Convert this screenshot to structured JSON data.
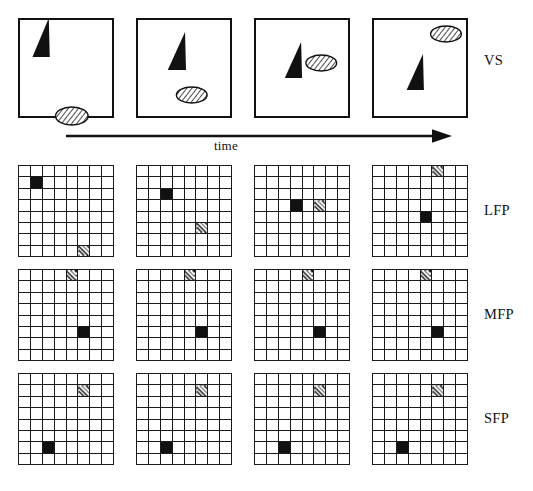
{
  "figure": {
    "colors": {
      "ink": "#111111",
      "background": "#ffffff",
      "grid_line": "#1a1a1a",
      "active_cell": "#111111",
      "hatch_cell": "#141414"
    },
    "time_axis": {
      "label": "time",
      "direction": "left-to-right",
      "arrowhead": "right"
    },
    "row_labels": [
      {
        "id": "vs",
        "text": "VS"
      },
      {
        "id": "lfp",
        "text": "LFP"
      },
      {
        "id": "mfp",
        "text": "MFP"
      },
      {
        "id": "sfp",
        "text": "SFP"
      }
    ],
    "timesteps": 4,
    "grid": {
      "rows": 8,
      "cols": 8
    },
    "vs_frames": [
      {
        "index": 1,
        "triangle": {
          "apex_x_pct": 30,
          "apex_y_pct": -2,
          "base_left_x_pct": 13,
          "base_right_x_pct": 31,
          "base_y_pct": 37
        },
        "ellipse": {
          "cx_pct": 54,
          "cy_pct": 96,
          "rx_pct": 17,
          "ry_pct": 9,
          "fill": "hatched"
        }
      },
      {
        "index": 2,
        "triangle": {
          "apex_x_pct": 49,
          "apex_y_pct": 12,
          "base_left_x_pct": 31,
          "base_right_x_pct": 50,
          "base_y_pct": 50
        },
        "ellipse": {
          "cx_pct": 56,
          "cy_pct": 75,
          "rx_pct": 16,
          "ry_pct": 8,
          "fill": "hatched"
        }
      },
      {
        "index": 3,
        "triangle": {
          "apex_x_pct": 47,
          "apex_y_pct": 22,
          "base_left_x_pct": 30,
          "base_right_x_pct": 48,
          "base_y_pct": 58
        },
        "ellipse": {
          "cx_pct": 68,
          "cy_pct": 43,
          "rx_pct": 16,
          "ry_pct": 8,
          "fill": "hatched"
        }
      },
      {
        "index": 4,
        "triangle": {
          "apex_x_pct": 51,
          "apex_y_pct": 34,
          "base_left_x_pct": 34,
          "base_right_x_pct": 52,
          "base_y_pct": 70
        },
        "ellipse": {
          "cx_pct": 75,
          "cy_pct": 14,
          "rx_pct": 16,
          "ry_pct": 8,
          "fill": "hatched"
        }
      }
    ],
    "feature_planes": [
      {
        "id": "lfp",
        "label": "LFP",
        "frames": [
          {
            "index": 1,
            "active_cell": {
              "row": 2,
              "col": 2
            },
            "hatch_cell": {
              "row": 8,
              "col": 6
            }
          },
          {
            "index": 2,
            "active_cell": {
              "row": 3,
              "col": 3
            },
            "hatch_cell": {
              "row": 6,
              "col": 6
            }
          },
          {
            "index": 3,
            "active_cell": {
              "row": 4,
              "col": 4
            },
            "hatch_cell": {
              "row": 4,
              "col": 6
            }
          },
          {
            "index": 4,
            "active_cell": {
              "row": 5,
              "col": 5
            },
            "hatch_cell": {
              "row": 1,
              "col": 6
            }
          }
        ]
      },
      {
        "id": "mfp",
        "label": "MFP",
        "frames": [
          {
            "index": 1,
            "active_cell": {
              "row": 6,
              "col": 6
            },
            "hatch_cell": {
              "row": 1,
              "col": 5
            }
          },
          {
            "index": 2,
            "active_cell": {
              "row": 6,
              "col": 6
            },
            "hatch_cell": {
              "row": 1,
              "col": 5
            }
          },
          {
            "index": 3,
            "active_cell": {
              "row": 6,
              "col": 6
            },
            "hatch_cell": {
              "row": 1,
              "col": 5
            }
          },
          {
            "index": 4,
            "active_cell": {
              "row": 6,
              "col": 6
            },
            "hatch_cell": {
              "row": 1,
              "col": 5
            }
          }
        ]
      },
      {
        "id": "sfp",
        "label": "SFP",
        "frames": [
          {
            "index": 1,
            "active_cell": {
              "row": 7,
              "col": 3
            },
            "hatch_cell": {
              "row": 2,
              "col": 6
            }
          },
          {
            "index": 2,
            "active_cell": {
              "row": 7,
              "col": 3
            },
            "hatch_cell": {
              "row": 2,
              "col": 6
            }
          },
          {
            "index": 3,
            "active_cell": {
              "row": 7,
              "col": 3
            },
            "hatch_cell": {
              "row": 2,
              "col": 6
            }
          },
          {
            "index": 4,
            "active_cell": {
              "row": 7,
              "col": 3
            },
            "hatch_cell": {
              "row": 2,
              "col": 6
            }
          }
        ]
      }
    ]
  },
  "layout": {
    "panel_x": [
      18,
      136,
      254,
      372
    ],
    "panel_width": 96,
    "vs_y": 18,
    "vs_height": 100,
    "arrow": {
      "x1": 66,
      "x2": 452,
      "y": 136
    },
    "time_label": {
      "x": 214,
      "y": 138
    },
    "grid_rows_y": [
      165,
      269,
      373
    ],
    "grid_height": 92,
    "label_x": 484,
    "label_y": [
      52,
      202,
      306,
      410
    ]
  }
}
